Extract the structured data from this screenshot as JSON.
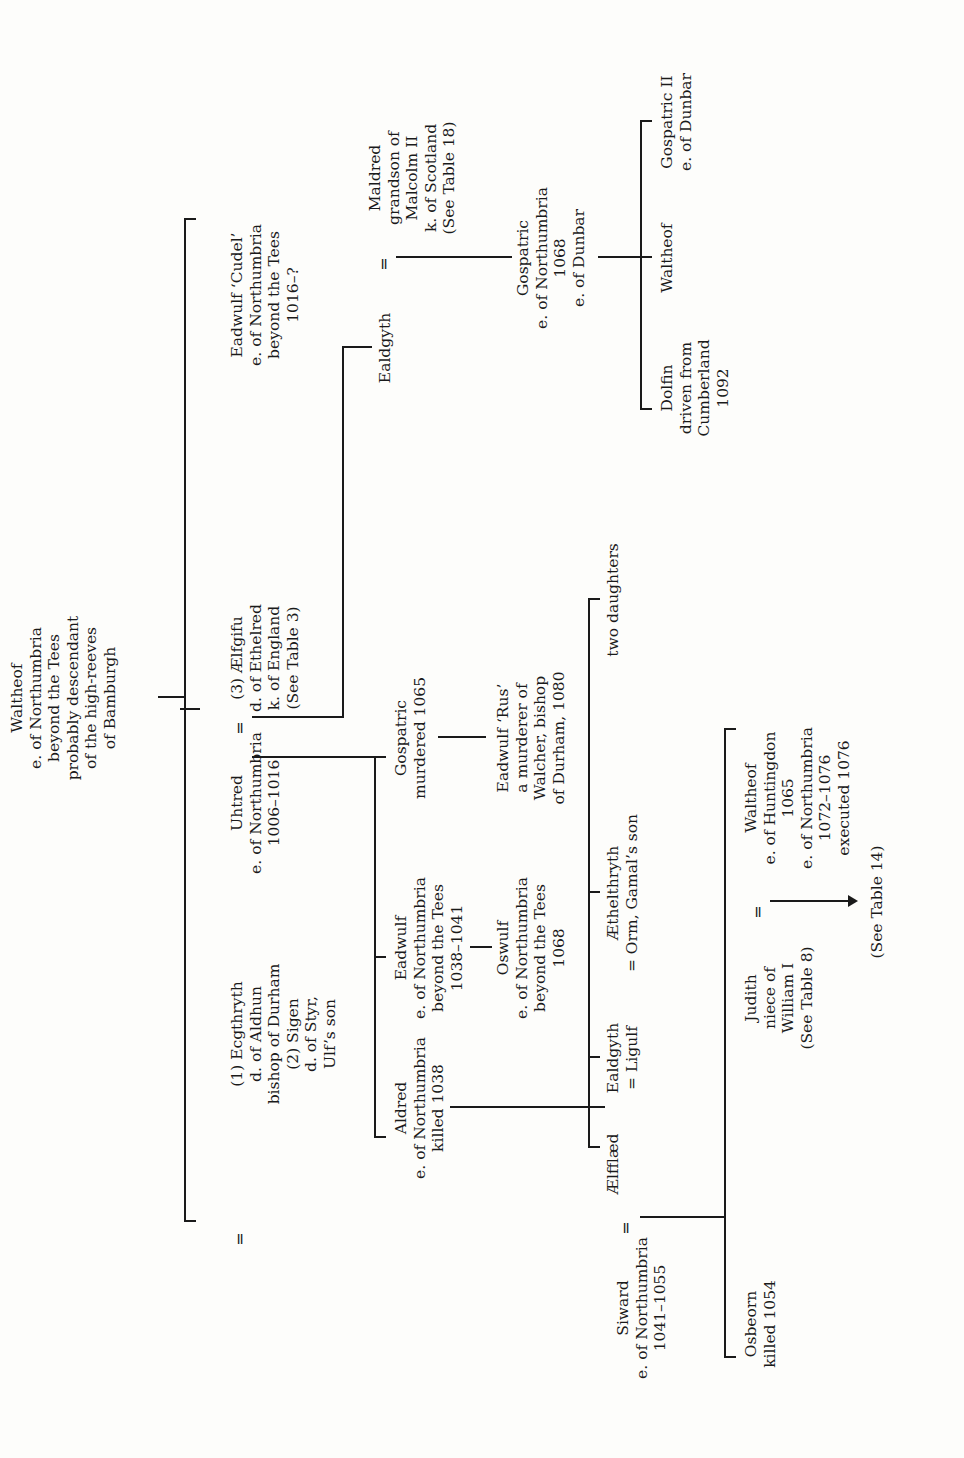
{
  "table": {
    "orientation": "rotated-90-ccw",
    "root": {
      "id": "waltheof-root",
      "lines": [
        "Waltheof",
        "e. of Northumbria",
        "beyond the Tees",
        "probably descendant",
        "of the high-reeves",
        "of Bamburgh"
      ]
    },
    "generation1": {
      "uhtred": {
        "lines": [
          "Uhtred",
          "e. of Northumbria",
          "1006–1016"
        ]
      },
      "uhtred_wives_first": {
        "lines": [
          "(1) Ecgthryth",
          "d. of Aldhun",
          "bishop of Durham",
          "(2) Sigen",
          "d. of Styr,",
          "Ulf’s son"
        ]
      },
      "aelfgifu": {
        "lines": [
          "(3) Ælfgifu",
          "d. of Ethelred",
          "k. of England",
          "(See Table 3)"
        ]
      },
      "eadwulf_cudel": {
        "lines": [
          "Eadwulf ‘Cudel’",
          "e. of Northumbria",
          "beyond the Tees",
          "1016–?"
        ]
      }
    },
    "generation2": {
      "aldred": {
        "lines": [
          "Aldred",
          "e. of Northumbria",
          "killed 1038"
        ]
      },
      "eadwulf": {
        "lines": [
          "Eadwulf",
          "e. of Northumbria",
          "beyond the Tees",
          "1038–1041"
        ]
      },
      "gospatric_murdered": {
        "lines": [
          "Gospatric",
          "murdered 1065"
        ]
      },
      "ealdgyth": {
        "lines": [
          "Ealdgyth"
        ]
      },
      "maldred": {
        "lines": [
          "Maldred",
          "grandson of",
          "Malcolm II",
          "k. of Scotland",
          "(See Table 18)"
        ]
      }
    },
    "generation3": {
      "oswulf": {
        "lines": [
          "Oswulf",
          "e. of Northumbria",
          "beyond the Tees",
          "1068"
        ]
      },
      "eadwulf_rus": {
        "lines": [
          "Eadwulf ‘Rus’",
          "a murderer of",
          "Walcher, bishop",
          "of Durham, 1080"
        ]
      },
      "gospatric_dunbar": {
        "lines": [
          "Gospatric",
          "e. of Northumbria",
          "1068",
          "e. of Dunbar"
        ]
      },
      "siward": {
        "lines": [
          "Siward",
          "e. of Northumbria",
          "1041–1055"
        ]
      },
      "aelfflaed": {
        "lines": [
          "Ælfflæd"
        ]
      },
      "ealdgyth_ligulf": {
        "lines": [
          "Ealdgyth",
          "= Ligulf"
        ]
      },
      "aethelthryth": {
        "lines": [
          "Æthelthryth",
          "= Orm, Gamal’s son"
        ]
      },
      "two_daughters": {
        "lines": [
          "two daughters"
        ]
      }
    },
    "generation4": {
      "dolfin": {
        "lines": [
          "Dolfin",
          "driven from",
          "Cumberland",
          "1092"
        ]
      },
      "waltheof_dunbar_son": {
        "lines": [
          "Waltheof"
        ]
      },
      "gospatric_ii": {
        "lines": [
          "Gospatric II",
          "e. of Dunbar"
        ]
      },
      "osbeorn": {
        "lines": [
          "Osbeorn",
          "killed 1054"
        ]
      },
      "judith": {
        "lines": [
          "Judith",
          "niece of",
          "William I",
          "(See Table 8)"
        ]
      },
      "waltheof_huntingdon": {
        "lines": [
          "Waltheof",
          "e. of Huntingdon",
          "1065",
          "e. of Northumbria",
          "1072–1076",
          "executed 1076"
        ]
      },
      "see_table_14": {
        "lines": [
          "(See Table 14)"
        ]
      }
    },
    "marriage_sign": "="
  }
}
